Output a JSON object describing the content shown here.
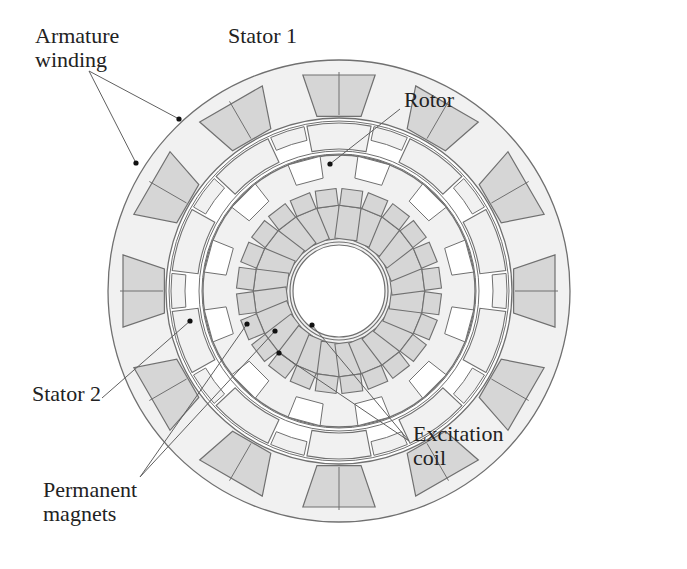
{
  "figure": {
    "type": "cross-section diagram",
    "colors": {
      "background": "#ffffff",
      "iron": "#f1f1f1",
      "coil": "#d6d6d6",
      "outline": "#707070",
      "leader": "#606060",
      "text": "#222222"
    },
    "geometry": {
      "center": [
        339,
        291
      ],
      "stator1_outer_r": 231,
      "stator1_slot_outer_r": 219,
      "stator1_slot_inner_r": 174,
      "stator1_inner_r": 173,
      "stator1_slots": 12,
      "rotor_outer_r": 170,
      "rotor_inner_r": 140,
      "rotor_segments": 10,
      "stator2_outer_r": 136,
      "stator2_inner_r": 49,
      "stator2_coils": 24,
      "shaft_r": 46
    }
  },
  "labels": [
    {
      "id": "armature-winding",
      "lines": [
        "Armature",
        "winding"
      ],
      "x": 35,
      "y": 24
    },
    {
      "id": "stator-1",
      "lines": [
        "Stator 1"
      ],
      "x": 228,
      "y": 24
    },
    {
      "id": "rotor",
      "lines": [
        "Rotor"
      ],
      "x": 404,
      "y": 88
    },
    {
      "id": "stator-2",
      "lines": [
        "Stator 2"
      ],
      "x": 32,
      "y": 382
    },
    {
      "id": "permanent-magnets",
      "lines": [
        "Permanent",
        "magnets"
      ],
      "x": 43,
      "y": 478
    },
    {
      "id": "excitation-coil",
      "lines": [
        "Excitation",
        "coil"
      ],
      "x": 413,
      "y": 422
    }
  ],
  "leaders": [
    {
      "label": "armature-winding",
      "from": [
        89,
        71
      ],
      "to": [
        179,
        119
      ]
    },
    {
      "label": "armature-winding",
      "from": [
        89,
        71
      ],
      "to": [
        136,
        163
      ]
    },
    {
      "label": "rotor",
      "from": [
        400,
        109
      ],
      "to": [
        330,
        164
      ]
    },
    {
      "label": "stator-2",
      "from": [
        102,
        398
      ],
      "to": [
        190,
        321
      ]
    },
    {
      "label": "permanent-magnets",
      "from": [
        140,
        477
      ],
      "to": [
        247,
        324
      ]
    },
    {
      "label": "permanent-magnets",
      "from": [
        140,
        477
      ],
      "to": [
        275,
        331
      ]
    },
    {
      "label": "excitation-coil",
      "from": [
        409,
        441
      ],
      "to": [
        312,
        325
      ]
    },
    {
      "label": "excitation-coil",
      "from": [
        409,
        441
      ],
      "to": [
        279,
        353
      ]
    }
  ]
}
